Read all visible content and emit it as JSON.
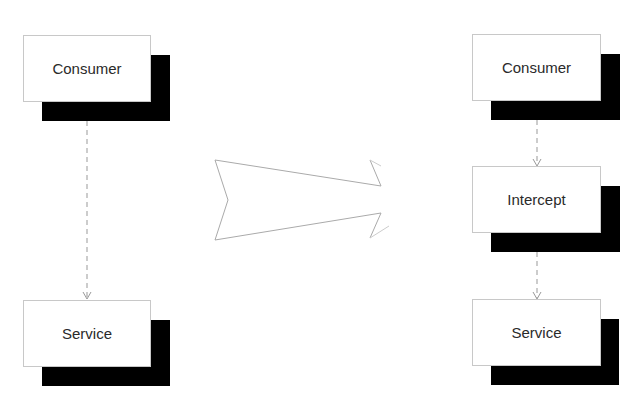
{
  "diagram": {
    "before": {
      "nodes": [
        {
          "id": "consumer",
          "label": "Consumer"
        },
        {
          "id": "service",
          "label": "Service"
        }
      ],
      "edges": [
        {
          "from": "consumer",
          "to": "service",
          "style": "dashed"
        }
      ]
    },
    "transform_arrow": {
      "direction": "right"
    },
    "after": {
      "nodes": [
        {
          "id": "consumer",
          "label": "Consumer"
        },
        {
          "id": "intercept",
          "label": "Intercept"
        },
        {
          "id": "service",
          "label": "Service"
        }
      ],
      "edges": [
        {
          "from": "consumer",
          "to": "intercept",
          "style": "dashed"
        },
        {
          "from": "intercept",
          "to": "service",
          "style": "dashed"
        }
      ]
    },
    "colors": {
      "shadow": "#000000",
      "box_fill": "#ffffff",
      "box_border": "#c8c8c8",
      "edge": "#999999",
      "arrow_outline": "#aaaaaa"
    }
  }
}
